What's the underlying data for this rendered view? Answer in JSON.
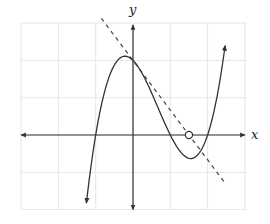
{
  "chart_data": {
    "type": "line",
    "title": "",
    "xlabel": "x",
    "ylabel": "y",
    "xlim": [
      -3,
      3
    ],
    "ylim": [
      -2,
      3
    ],
    "grid": true,
    "tick_labels": false,
    "series": [
      {
        "name": "cubic curve",
        "function": "f(x) = (x+1)(x-1)(x-2)",
        "style": "solid",
        "x": [
          -1.25,
          -1.0,
          -0.5,
          -0.22,
          0,
          0.5,
          1.0,
          1.55,
          2.0,
          2.47
        ],
        "y": [
          -1.83,
          0,
          1.88,
          2.11,
          2.0,
          1.13,
          0,
          -0.63,
          0,
          2.4
        ],
        "arrows_at_ends": true
      },
      {
        "name": "tangent line at (0, 2)",
        "style": "dashed",
        "x": [
          -0.85,
          2.5
        ],
        "y": [
          3.13,
          -1.33
        ]
      }
    ],
    "annotations": [
      {
        "type": "open-circle",
        "x": 1.5,
        "y": 0,
        "note": "x-intercept of tangent line"
      }
    ]
  },
  "labels": {
    "x_axis": "x",
    "y_axis": "y"
  },
  "colors": {
    "grid": "#e6e6e6",
    "axis": "#333333",
    "curve": "#333333",
    "tangent": "#444444"
  }
}
